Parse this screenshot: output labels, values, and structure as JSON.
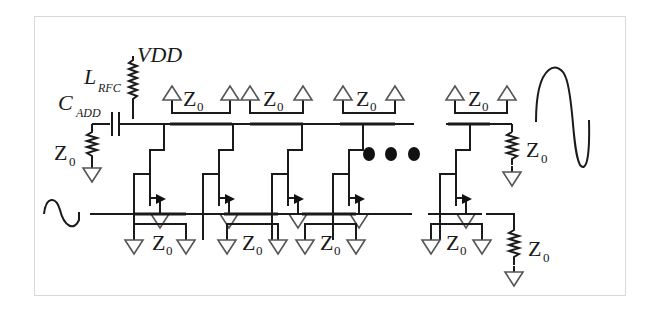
{
  "diagram": {
    "type": "distributed-amplifier-schematic",
    "labels": {
      "vdd": "VDD",
      "l_rfc_main": "L",
      "l_rfc_sub": "RFC",
      "c_add_main": "C",
      "c_add_sub": "ADD",
      "z_main": "Z",
      "z_sub": "0"
    },
    "stages_drawn": 5,
    "ellipsis": "• • •",
    "colors": {
      "wire": "#1a1a1a",
      "ground": "#555555",
      "frame_border": "#d8d8d8",
      "background": "#ffffff"
    }
  }
}
